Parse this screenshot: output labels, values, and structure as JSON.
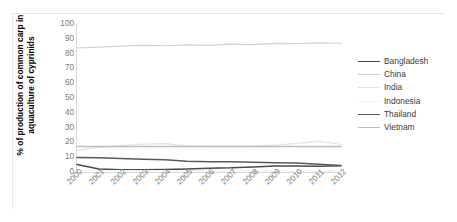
{
  "chart_data": {
    "type": "line",
    "title": "",
    "xlabel": "",
    "ylabel": "% of production of common carp in aquaculture of cyprinids",
    "categories": [
      "2000",
      "2001",
      "2002",
      "2003",
      "2004",
      "2005",
      "2006",
      "2007",
      "2008",
      "2009",
      "2010",
      "2011",
      "2012"
    ],
    "x": [
      2000,
      2001,
      2002,
      2003,
      2004,
      2005,
      2006,
      2007,
      2008,
      2009,
      2010,
      2011,
      2012
    ],
    "ylim": [
      0,
      100
    ],
    "ytick_labels": [
      "100",
      "90",
      "80",
      "70",
      "60",
      "50",
      "40",
      "30",
      "20",
      "10",
      "0"
    ],
    "ytick_values": [
      100,
      90,
      80,
      70,
      60,
      50,
      40,
      30,
      20,
      10,
      0
    ],
    "grid": false,
    "legend_position": "right",
    "series": [
      {
        "name": "Bangladesh",
        "color": "#4a4a4a",
        "width": 1.5,
        "values": [
          5.0,
          2.0,
          1.6,
          1.6,
          1.7,
          2.0,
          2.6,
          2.8,
          3.4,
          4.0,
          4.1,
          3.9,
          4.2
        ]
      },
      {
        "name": "China",
        "color": "#d2d2d2",
        "width": 1.2,
        "values": [
          83.8,
          84.4,
          85.0,
          85.6,
          85.3,
          85.9,
          85.6,
          86.4,
          86.0,
          86.9,
          86.7,
          87.2,
          87.0
        ]
      },
      {
        "name": "India",
        "color": "#e3e3e3",
        "width": 1.2,
        "values": [
          14.4,
          16.8,
          17.8,
          18.8,
          19.2,
          17.6,
          17.4,
          17.4,
          17.5,
          18.2,
          19.3,
          20.8,
          18.6
        ]
      },
      {
        "name": "Indonesia",
        "color": "#f2f2f2",
        "width": 1.2,
        "values": [
          1.0,
          1.0,
          1.0,
          0.9,
          0.9,
          0.9,
          0.8,
          0.8,
          0.7,
          0.7,
          0.6,
          0.6,
          0.6
        ]
      },
      {
        "name": "Thailand",
        "color": "#5a5a5a",
        "width": 1.5,
        "values": [
          9.8,
          9.6,
          9.2,
          8.6,
          8.2,
          7.3,
          7.0,
          6.9,
          6.6,
          6.3,
          6.0,
          5.2,
          4.4
        ]
      },
      {
        "name": "Vietnam",
        "color": "#bdbdbd",
        "width": 1.4,
        "values": [
          17.2,
          17.2,
          17.2,
          17.2,
          17.2,
          17.2,
          17.2,
          17.2,
          17.2,
          17.2,
          17.2,
          17.2,
          17.2
        ]
      }
    ]
  },
  "legend": {
    "items": [
      {
        "label": "Bangladesh"
      },
      {
        "label": "China"
      },
      {
        "label": "India"
      },
      {
        "label": "Indonesia"
      },
      {
        "label": "Thailand"
      },
      {
        "label": "Vietnam"
      }
    ]
  }
}
